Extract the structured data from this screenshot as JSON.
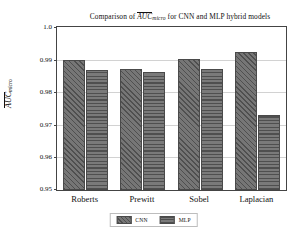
{
  "chart_data": {
    "type": "bar",
    "title_parts": {
      "prefix": "Comparison of ",
      "overline_term": "AUC",
      "subscript": "micro",
      "suffix": " for CNN and MLP hybrid models"
    },
    "xlabel": "",
    "ylabel": "AUC_micro",
    "ylabel_parts": {
      "overline_term": "AUC",
      "subscript": "micro"
    },
    "categories": [
      "Roberts",
      "Prewitt",
      "Sobel",
      "Laplacian"
    ],
    "series": [
      {
        "name": "CNN",
        "values": [
          0.99,
          0.9871,
          0.9901,
          0.9922
        ],
        "hatch": "diagonal"
      },
      {
        "name": "MLP",
        "values": [
          0.9869,
          0.9861,
          0.9871,
          0.973
        ],
        "hatch": "horizontal"
      }
    ],
    "ylim": [
      0.95,
      1.0
    ],
    "yticks": [
      0.95,
      0.96,
      0.97,
      0.98,
      0.99,
      1.0
    ],
    "ytick_labels": [
      "0.95",
      "0.96",
      "0.97",
      "0.98",
      "0.99",
      "1.0"
    ],
    "grid": true,
    "legend_position": "below-axes",
    "colors": {
      "bar_fill": "#6e6e6e",
      "bar_edge": "#4a4a4a",
      "hatch": "#4f4f4f",
      "grid": "#d2d2d2",
      "axis": "#444444",
      "text": "#111111",
      "background": "#ffffff"
    }
  }
}
